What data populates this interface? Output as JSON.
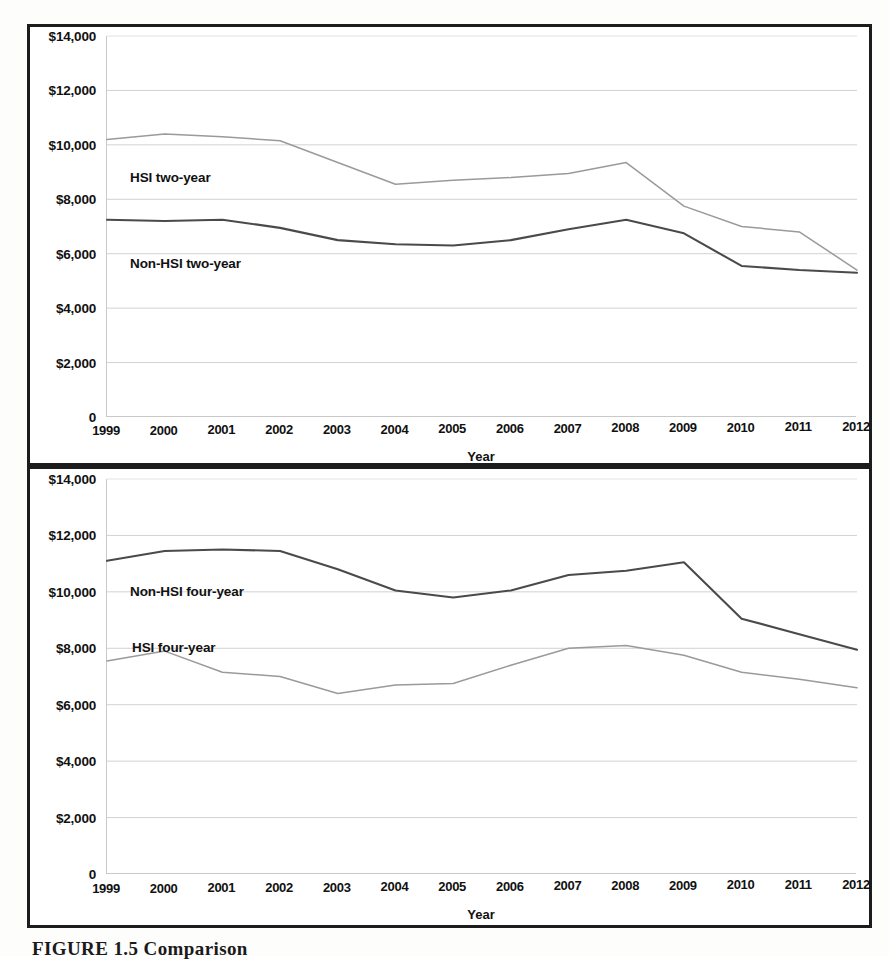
{
  "figure": {
    "caption": "FIGURE 1.5  Comparison",
    "axis_title_x": "Year",
    "ytick_labels": [
      "$14,000",
      "$12,000",
      "$10,000",
      "$8,000",
      "$6,000",
      "$4,000",
      "$2,000",
      "0"
    ],
    "ytick_values": [
      14000,
      12000,
      10000,
      8000,
      6000,
      4000,
      2000,
      0
    ],
    "xtick_labels": [
      "1999",
      "2000",
      "2001",
      "2002",
      "2003",
      "2004",
      "2005",
      "2006",
      "2007",
      "2008",
      "2009",
      "2010",
      "2011",
      "2012"
    ]
  },
  "colors": {
    "line_light": "#9a9a9a",
    "line_dark": "#4a4a4a",
    "grid": "#d2d2d2",
    "frame": "#1c1c1c",
    "text": "#111111"
  },
  "chart_data": [
    {
      "type": "line",
      "title": "Two-year institutions",
      "xlabel": "Year",
      "ylabel": "",
      "grid": true,
      "legend": "inline-labels",
      "ylim": [
        0,
        14000
      ],
      "ytick_step": 2000,
      "categories": [
        "1999",
        "2000",
        "2001",
        "2002",
        "2003",
        "2004",
        "2005",
        "2006",
        "2007",
        "2008",
        "2009",
        "2010",
        "2011",
        "2012"
      ],
      "series": [
        {
          "name": "HSI two-year",
          "color": "#9a9a9a",
          "label_x": "1999",
          "values": [
            10200,
            10400,
            10300,
            10150,
            9350,
            8550,
            8700,
            8800,
            8950,
            9350,
            7750,
            7000,
            6800,
            5400
          ]
        },
        {
          "name": "Non-HSI two-year",
          "color": "#4a4a4a",
          "label_x": "1999",
          "values": [
            7250,
            7200,
            7250,
            6950,
            6500,
            6350,
            6300,
            6500,
            6900,
            7250,
            6750,
            5550,
            5400,
            5300
          ]
        }
      ]
    },
    {
      "type": "line",
      "title": "Four-year institutions",
      "xlabel": "Year",
      "ylabel": "",
      "grid": true,
      "legend": "inline-labels",
      "ylim": [
        0,
        14000
      ],
      "ytick_step": 2000,
      "categories": [
        "1999",
        "2000",
        "2001",
        "2002",
        "2003",
        "2004",
        "2005",
        "2006",
        "2007",
        "2008",
        "2009",
        "2010",
        "2011",
        "2012"
      ],
      "series": [
        {
          "name": "Non-HSI four-year",
          "color": "#4a4a4a",
          "label_x": "1999",
          "values": [
            11100,
            11450,
            11500,
            11450,
            10800,
            10050,
            9800,
            10050,
            10600,
            10750,
            11050,
            9050,
            8500,
            7950
          ]
        },
        {
          "name": "HSI four-year",
          "color": "#9a9a9a",
          "label_x": "1999",
          "values": [
            7550,
            7900,
            7150,
            7000,
            6400,
            6700,
            6750,
            7400,
            8000,
            8100,
            7750,
            7150,
            6900,
            6600
          ]
        }
      ]
    }
  ]
}
